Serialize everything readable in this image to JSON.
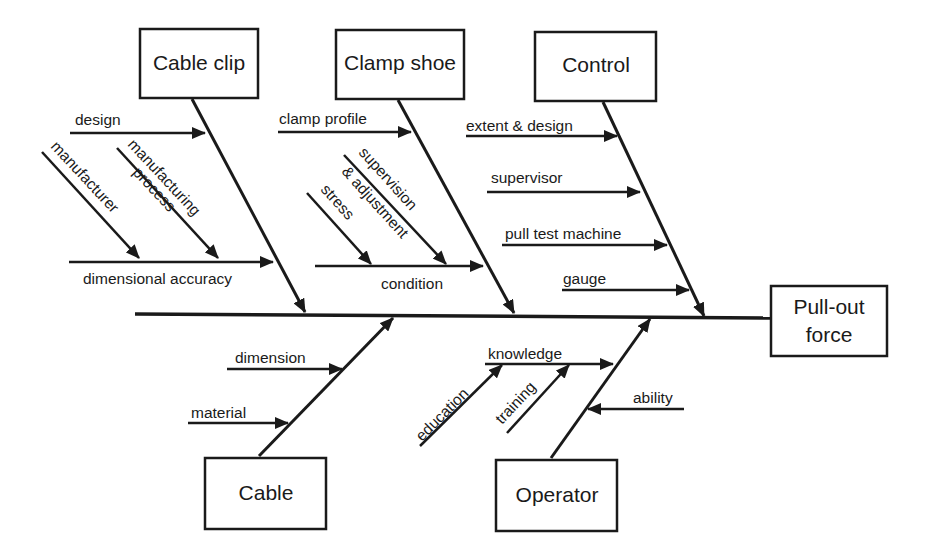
{
  "diagram": {
    "type": "fishbone",
    "effect": {
      "label_line1": "Pull-out",
      "label_line2": "force"
    },
    "categories": {
      "cable_clip": {
        "label": "Cable clip",
        "causes": {
          "design": "design",
          "dimensional_accuracy": "dimensional accuracy",
          "manufacturer": "manufacturer",
          "manufacturing_process_line1": "manufacturing",
          "manufacturing_process_line2": "process"
        }
      },
      "clamp_shoe": {
        "label": "Clamp shoe",
        "causes": {
          "clamp_profile": "clamp profile",
          "condition": "condition",
          "stress": "stress",
          "supervision_line1": "supervision",
          "supervision_line2": "& adjustment"
        }
      },
      "control": {
        "label": "Control",
        "causes": {
          "extent_design": "extent & design",
          "supervisor": "supervisor",
          "pull_test_machine": "pull test machine",
          "gauge": "gauge"
        }
      },
      "cable": {
        "label": "Cable",
        "causes": {
          "dimension": "dimension",
          "material": "material"
        }
      },
      "operator": {
        "label": "Operator",
        "causes": {
          "knowledge": "knowledge",
          "education": "education",
          "training": "training",
          "ability": "ability"
        }
      }
    }
  }
}
